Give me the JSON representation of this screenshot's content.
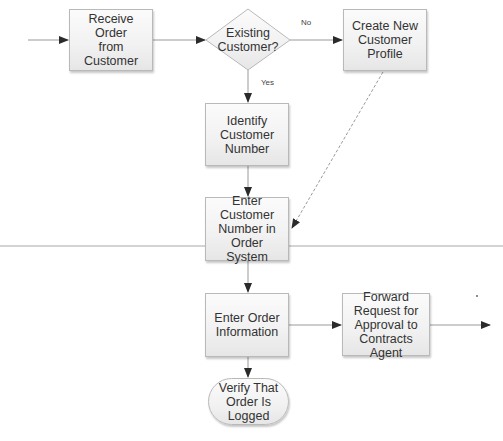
{
  "diagram": {
    "type": "flowchart",
    "nodes": [
      {
        "id": "receive",
        "shape": "process",
        "label": "Receive Order\nfrom Customer"
      },
      {
        "id": "existing",
        "shape": "decision",
        "label": "Existing\nCustomer?"
      },
      {
        "id": "create",
        "shape": "process",
        "label": "Create New\nCustomer\nProfile"
      },
      {
        "id": "identify",
        "shape": "process",
        "label": "Identify\nCustomer\nNumber"
      },
      {
        "id": "enter_number",
        "shape": "process",
        "label": "Enter\nCustomer\nNumber in\nOrder System"
      },
      {
        "id": "enter_order",
        "shape": "process",
        "label": "Enter Order\nInformation"
      },
      {
        "id": "forward",
        "shape": "process",
        "label": "Forward\nRequest for\nApproval to\nContracts Agent"
      },
      {
        "id": "verify",
        "shape": "terminator",
        "label": "Verify That\nOrder Is\nLogged"
      }
    ],
    "edges": [
      {
        "from": "start",
        "to": "receive",
        "label": ""
      },
      {
        "from": "receive",
        "to": "existing",
        "label": ""
      },
      {
        "from": "existing",
        "to": "create",
        "label": "No"
      },
      {
        "from": "existing",
        "to": "identify",
        "label": "Yes"
      },
      {
        "from": "identify",
        "to": "enter_number",
        "label": ""
      },
      {
        "from": "create",
        "to": "enter_number",
        "label": "",
        "style": "dashed"
      },
      {
        "from": "enter_number",
        "to": "enter_order",
        "label": ""
      },
      {
        "from": "enter_order",
        "to": "forward",
        "label": ""
      },
      {
        "from": "forward",
        "to": "end",
        "label": ""
      },
      {
        "from": "enter_order",
        "to": "verify",
        "label": ""
      }
    ],
    "edge_labels": {
      "no": "No",
      "yes": "Yes"
    },
    "colors": {
      "line": "#9a9a9a",
      "arrow": "#2b2b2b",
      "border": "#b9b9b9",
      "text": "#333333"
    }
  }
}
